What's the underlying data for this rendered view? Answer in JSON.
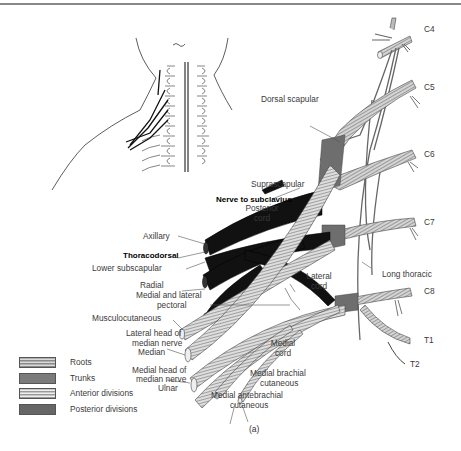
{
  "figure": {
    "caption": "(a)"
  },
  "roots": [
    {
      "id": "C4",
      "label": "C4"
    },
    {
      "id": "C5",
      "label": "C5"
    },
    {
      "id": "C6",
      "label": "C6"
    },
    {
      "id": "C7",
      "label": "C7"
    },
    {
      "id": "C8",
      "label": "C8"
    },
    {
      "id": "T1",
      "label": "T1"
    },
    {
      "id": "T2",
      "label": "T2"
    }
  ],
  "labels": {
    "dorsal_scapular": "Dorsal scapular",
    "suprascapular": "Suprascapular",
    "nerve_to_subclavius": "Nerve to subclavius",
    "posterior_cord_1": "Posterior",
    "posterior_cord_2": "cord",
    "axillary": "Axillary",
    "thoracodorsal": "Thoracodorsal",
    "lower_subscapular": "Lower subscapular",
    "radial": "Radial",
    "medial_lateral_pectoral_1": "Medial and lateral",
    "medial_lateral_pectoral_2": "pectoral",
    "musculocutaneous": "Musculocutaneous",
    "lateral_head_median_1": "Lateral head of",
    "lateral_head_median_2": "median nerve",
    "median": "Median",
    "medial_head_median_1": "Medial head of",
    "medial_head_median_2": "median nerve",
    "ulnar": "Ulnar",
    "lateral_cord_1": "Lateral",
    "lateral_cord_2": "cord",
    "long_thoracic": "Long thoracic",
    "medial_cord_1": "Medial",
    "medial_cord_2": "cord",
    "medial_brachial_cutaneous_1": "Medial brachial",
    "medial_brachial_cutaneous_2": "cutaneous",
    "medial_antebrachial_cutaneous_1": "Medial antebrachial",
    "medial_antebrachial_cutaneous_2": "cutaneous"
  },
  "legend": [
    {
      "key": "roots",
      "label": "Roots",
      "pattern": "striped-gray"
    },
    {
      "key": "trunks",
      "label": "Trunks",
      "pattern": "solid-gray"
    },
    {
      "key": "anterior",
      "label": "Anterior divisions",
      "pattern": "striped-light"
    },
    {
      "key": "posterior",
      "label": "Posterior divisions",
      "pattern": "solid-dark-gray"
    }
  ],
  "colors": {
    "roots": "#b0b0b0",
    "trunks": "#6e6e6e",
    "anterior": "#d0d0d0",
    "posterior": "#5a5a5a",
    "posterior_cord": "#111111",
    "outline": "#444444"
  }
}
